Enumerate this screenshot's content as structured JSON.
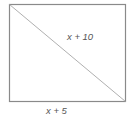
{
  "diagram": {
    "shape": "rectangle",
    "diagonal": "top-left to bottom-right",
    "labels": {
      "diagonal": "x + 10",
      "bottom_side": "x + 5"
    },
    "colors": {
      "stroke": "#8a8a8a",
      "diagonal": "#b0b0b0",
      "text": "#555555",
      "background": "#ffffff"
    }
  }
}
